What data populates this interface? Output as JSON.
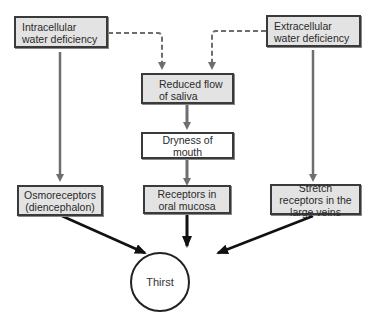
{
  "nodes": {
    "intracellular": "Intracellular water deficiency",
    "extracellular": "Extracellular water deficiency",
    "reduced_flow": "Reduced flow of saliva",
    "dryness": "Dryness of mouth",
    "osmoreceptors": "Osmoreceptors (diencephalon)",
    "oral_receptors": "Receptors in oral mucosa",
    "stretch_receptors": "Stretch receptors in the large veins",
    "thirst": "Thirst"
  },
  "edges": [
    {
      "from": "intracellular",
      "to": "reduced_flow",
      "style": "dashed"
    },
    {
      "from": "extracellular",
      "to": "reduced_flow",
      "style": "dashed"
    },
    {
      "from": "intracellular",
      "to": "osmoreceptors",
      "style": "solid-gray"
    },
    {
      "from": "extracellular",
      "to": "stretch_receptors",
      "style": "solid-gray"
    },
    {
      "from": "reduced_flow",
      "to": "dryness",
      "style": "solid-gray"
    },
    {
      "from": "dryness",
      "to": "oral_receptors",
      "style": "solid-gray"
    },
    {
      "from": "osmoreceptors",
      "to": "thirst",
      "style": "solid-black"
    },
    {
      "from": "oral_receptors",
      "to": "thirst",
      "style": "solid-black"
    },
    {
      "from": "stretch_receptors",
      "to": "thirst",
      "style": "solid-black"
    }
  ],
  "colors": {
    "box_fill": "#e3e3e3",
    "border": "#3a3a3a",
    "gray_arrow": "#6e6e6e",
    "black_arrow": "#111111"
  }
}
